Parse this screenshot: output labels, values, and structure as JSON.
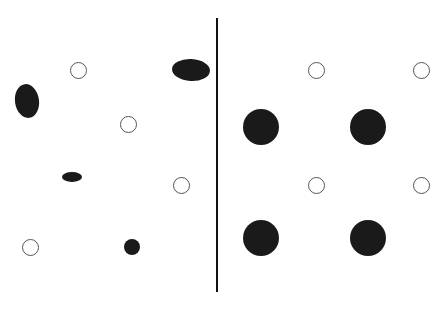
{
  "figure": {
    "width": 439,
    "height": 315,
    "background_color": "#ffffff",
    "ink_color": "#1a1a1a",
    "outline_color": "#555555"
  },
  "divider": {
    "name": "vertical-divider-line",
    "x": 216,
    "y_top": 18,
    "y_bottom": 292,
    "thickness": 2,
    "color": "#111111"
  },
  "panels": [
    {
      "id": "left-panel",
      "label": "Irregular arrangement",
      "x": 0,
      "width": 216
    },
    {
      "id": "right-panel",
      "label": "Regular arrangement",
      "x": 218,
      "width": 221
    }
  ],
  "chart_data": {
    "type": "scatter",
    "xlabel": "",
    "ylabel": "",
    "xlim": [
      0,
      439
    ],
    "ylim": [
      0,
      315
    ],
    "grid": false,
    "legend": "none",
    "annotations": [
      {
        "type": "line",
        "name": "vertical-divider-line",
        "x1": 217,
        "y1": 18,
        "x2": 217,
        "y2": 292,
        "color": "#111111",
        "width": 2
      }
    ],
    "series": [
      {
        "name": "left-irregular-filled",
        "panel": "left-panel",
        "fill": "#1a1a1a",
        "style": "filled",
        "points": [
          {
            "id": "L-f1",
            "cx": 27,
            "cy": 101,
            "rx": 12,
            "ry": 17,
            "rotation": -8
          },
          {
            "id": "L-f2",
            "cx": 191,
            "cy": 70,
            "rx": 19,
            "ry": 11,
            "rotation": 3
          },
          {
            "id": "L-f3",
            "cx": 72,
            "cy": 177,
            "rx": 10,
            "ry": 5,
            "rotation": 0
          },
          {
            "id": "L-f4",
            "cx": 132,
            "cy": 247,
            "rx": 8,
            "ry": 8,
            "rotation": 0
          }
        ]
      },
      {
        "name": "left-irregular-outline",
        "panel": "left-panel",
        "fill": "none",
        "stroke": "#555555",
        "style": "outline",
        "points": [
          {
            "id": "L-o1",
            "cx": 78,
            "cy": 70,
            "rx": 8.5,
            "ry": 8.5,
            "rotation": 0
          },
          {
            "id": "L-o2",
            "cx": 128,
            "cy": 124,
            "rx": 8.5,
            "ry": 8.5,
            "rotation": 0
          },
          {
            "id": "L-o3",
            "cx": 181,
            "cy": 185,
            "rx": 8.5,
            "ry": 8.5,
            "rotation": 0
          },
          {
            "id": "L-o4",
            "cx": 30,
            "cy": 247,
            "rx": 8.5,
            "ry": 8.5,
            "rotation": 0
          }
        ]
      },
      {
        "name": "right-regular-filled",
        "panel": "right-panel",
        "fill": "#1a1a1a",
        "style": "filled",
        "points": [
          {
            "id": "R-f1",
            "cx": 261,
            "cy": 127,
            "rx": 18,
            "ry": 18,
            "rotation": 0
          },
          {
            "id": "R-f2",
            "cx": 368,
            "cy": 127,
            "rx": 18,
            "ry": 18,
            "rotation": 0
          },
          {
            "id": "R-f3",
            "cx": 261,
            "cy": 238,
            "rx": 18,
            "ry": 18,
            "rotation": 0
          },
          {
            "id": "R-f4",
            "cx": 368,
            "cy": 238,
            "rx": 18,
            "ry": 18,
            "rotation": 0
          }
        ]
      },
      {
        "name": "right-regular-outline",
        "panel": "right-panel",
        "fill": "none",
        "stroke": "#555555",
        "style": "outline",
        "points": [
          {
            "id": "R-o1",
            "cx": 316,
            "cy": 70,
            "rx": 8.5,
            "ry": 8.5,
            "rotation": 0
          },
          {
            "id": "R-o2",
            "cx": 421,
            "cy": 70,
            "rx": 8.5,
            "ry": 8.5,
            "rotation": 0
          },
          {
            "id": "R-o3",
            "cx": 316,
            "cy": 185,
            "rx": 8.5,
            "ry": 8.5,
            "rotation": 0
          },
          {
            "id": "R-o4",
            "cx": 421,
            "cy": 185,
            "rx": 8.5,
            "ry": 8.5,
            "rotation": 0
          }
        ]
      }
    ]
  }
}
